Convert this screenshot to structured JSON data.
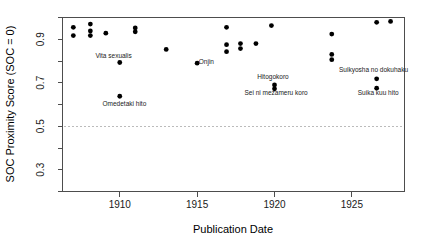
{
  "chart_data": {
    "type": "scatter",
    "title": "",
    "xlabel": "Publication Date",
    "ylabel": "SOC Proximity Score (SOC = 0)",
    "xlim": [
      1906.3,
      1928.4
    ],
    "ylim": [
      0.2,
      1.0
    ],
    "grid": false,
    "legend": null,
    "x_ticks": [
      1910,
      1915,
      1920,
      1925
    ],
    "x_tick_labels": [
      "1910",
      "1915",
      "1920",
      "1925"
    ],
    "y_ticks": [
      0.3,
      0.5,
      0.7,
      0.9
    ],
    "y_tick_labels": [
      "0.3",
      "0.5",
      "0.7",
      "0.9"
    ],
    "y_minor_ticks": [
      0.2,
      0.4,
      0.6,
      0.8,
      1.0
    ],
    "reference_line": {
      "orientation": "horizontal",
      "value": 0.5,
      "style": "dashed",
      "color": "#bbbbbb"
    },
    "points": [
      {
        "x": 1907.0,
        "y": 0.955,
        "label": ""
      },
      {
        "x": 1907.0,
        "y": 0.917,
        "label": ""
      },
      {
        "x": 1908.1,
        "y": 0.97,
        "label": ""
      },
      {
        "x": 1908.1,
        "y": 0.938,
        "label": ""
      },
      {
        "x": 1908.1,
        "y": 0.917,
        "label": ""
      },
      {
        "x": 1909.1,
        "y": 0.928,
        "label": ""
      },
      {
        "x": 1911.0,
        "y": 0.952,
        "label": ""
      },
      {
        "x": 1911.0,
        "y": 0.934,
        "label": ""
      },
      {
        "x": 1910.0,
        "y": 0.793,
        "label": "Vita sexualis"
      },
      {
        "x": 1910.0,
        "y": 0.638,
        "label": "Omedetaki hito"
      },
      {
        "x": 1913.0,
        "y": 0.853,
        "label": ""
      },
      {
        "x": 1915.0,
        "y": 0.79,
        "label": "Onjin"
      },
      {
        "x": 1916.9,
        "y": 0.955,
        "label": ""
      },
      {
        "x": 1916.9,
        "y": 0.875,
        "label": ""
      },
      {
        "x": 1916.9,
        "y": 0.843,
        "label": ""
      },
      {
        "x": 1917.8,
        "y": 0.88,
        "label": ""
      },
      {
        "x": 1917.8,
        "y": 0.857,
        "label": ""
      },
      {
        "x": 1918.8,
        "y": 0.88,
        "label": ""
      },
      {
        "x": 1919.8,
        "y": 0.963,
        "label": ""
      },
      {
        "x": 1920.0,
        "y": 0.69,
        "label": "Hitogokoro"
      },
      {
        "x": 1920.0,
        "y": 0.672,
        "label": "Sei ni mezameru koro"
      },
      {
        "x": 1923.7,
        "y": 0.924,
        "label": ""
      },
      {
        "x": 1923.7,
        "y": 0.83,
        "label": ""
      },
      {
        "x": 1923.7,
        "y": 0.806,
        "label": ""
      },
      {
        "x": 1926.6,
        "y": 0.978,
        "label": ""
      },
      {
        "x": 1927.5,
        "y": 0.982,
        "label": ""
      },
      {
        "x": 1926.6,
        "y": 0.718,
        "label": "Suikyosha no dokuhaku"
      },
      {
        "x": 1926.6,
        "y": 0.675,
        "label": "Suika kuu hito"
      }
    ],
    "annotations": [
      {
        "text": "Vita sexualis",
        "x": 1909.6,
        "y": 0.812
      },
      {
        "text": "Omedetaki hito",
        "x": 1910.3,
        "y": 0.592
      },
      {
        "text": "Onjin",
        "x": 1915.6,
        "y": 0.788
      },
      {
        "text": "Hitogokoro",
        "x": 1919.9,
        "y": 0.718
      },
      {
        "text": "Sei ni mezameru koro",
        "x": 1920.1,
        "y": 0.645
      },
      {
        "text": "Suikyosha no dokuhaku",
        "x": 1926.4,
        "y": 0.748
      },
      {
        "text": "Suika kuu hito",
        "x": 1926.7,
        "y": 0.645
      }
    ]
  },
  "axes": {
    "x_title": "Publication Date",
    "y_title": "SOC Proximity Score (SOC = 0)"
  }
}
